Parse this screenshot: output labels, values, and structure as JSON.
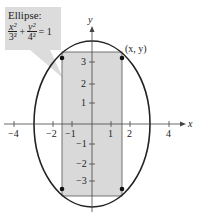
{
  "callout": {
    "title": "Ellipse:",
    "num1": "x²",
    "den1": "3²",
    "plus": "+",
    "num2": "y²",
    "den2": "4²",
    "equals": "= 1"
  },
  "axes": {
    "x_label": "x",
    "y_label": "y",
    "x_ticks": [
      "−4",
      "−2",
      "−1",
      "1",
      "2",
      "4"
    ],
    "y_ticks": [
      "3",
      "2",
      "1",
      "−1",
      "−2",
      "−3"
    ]
  },
  "point_label": "(x, y)",
  "colors": {
    "rect_fill": "#d9d9d9",
    "stroke": "#222222",
    "callout_bg": "#dcdcdc"
  }
}
